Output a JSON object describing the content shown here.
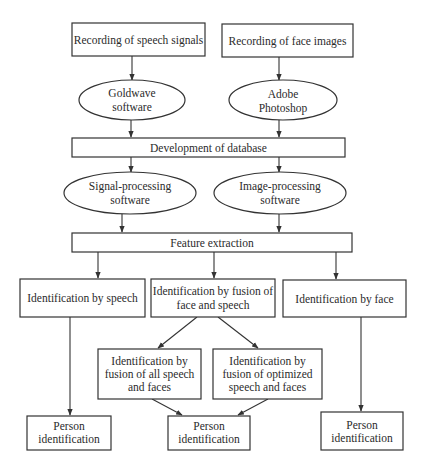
{
  "diagram": {
    "colors": {
      "stroke": "#333333",
      "text": "#2b2b2b",
      "background": "#ffffff"
    },
    "nodes": {
      "rec_speech": {
        "lines": [
          "Recording of speech signals"
        ]
      },
      "rec_face": {
        "lines": [
          "Recording of face images"
        ]
      },
      "goldwave": {
        "lines": [
          "Goldwave",
          "software"
        ]
      },
      "photoshop": {
        "lines": [
          "Adobe",
          "Photoshop"
        ]
      },
      "database": {
        "lines": [
          "Development of database"
        ]
      },
      "signal_proc": {
        "lines": [
          "Signal-processing",
          "software"
        ]
      },
      "image_proc": {
        "lines": [
          "Image-processing",
          "software"
        ]
      },
      "features": {
        "lines": [
          "Feature extraction"
        ]
      },
      "id_speech": {
        "lines": [
          "Identification by speech"
        ]
      },
      "id_fusion": {
        "lines": [
          "Identification by fusion of",
          "face and speech"
        ]
      },
      "id_face": {
        "lines": [
          "Identification by face"
        ]
      },
      "fusion_all": {
        "lines": [
          "Identification by",
          "fusion of all speech",
          "and faces"
        ]
      },
      "fusion_opt": {
        "lines": [
          "Identification by",
          "fusion of optimized",
          "speech and faces"
        ]
      },
      "person_left": {
        "lines": [
          "Person",
          "identification"
        ]
      },
      "person_center": {
        "lines": [
          "Person",
          "identification"
        ]
      },
      "person_right": {
        "lines": [
          "Person",
          "identification"
        ]
      }
    }
  }
}
